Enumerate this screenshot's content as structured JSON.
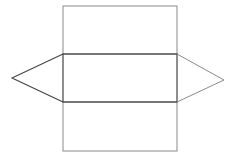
{
  "diagram": {
    "type": "triangular-prism-net",
    "canvas": {
      "width": 235,
      "height": 162,
      "background": "#ffffff"
    },
    "colors": {
      "stroke": "#555555",
      "stroke_dark": "#333333"
    },
    "rects": [
      {
        "name": "top-face",
        "x": 63,
        "y": 6,
        "w": 114,
        "h": 48
      },
      {
        "name": "middle-face",
        "x": 63,
        "y": 54,
        "w": 114,
        "h": 48
      },
      {
        "name": "bottom-face",
        "x": 63,
        "y": 102,
        "w": 114,
        "h": 49
      }
    ],
    "triangles": [
      {
        "name": "left-face",
        "points": "63,54 12,78 63,102"
      },
      {
        "name": "right-face",
        "points": "177,54 224,80 177,102"
      }
    ]
  }
}
